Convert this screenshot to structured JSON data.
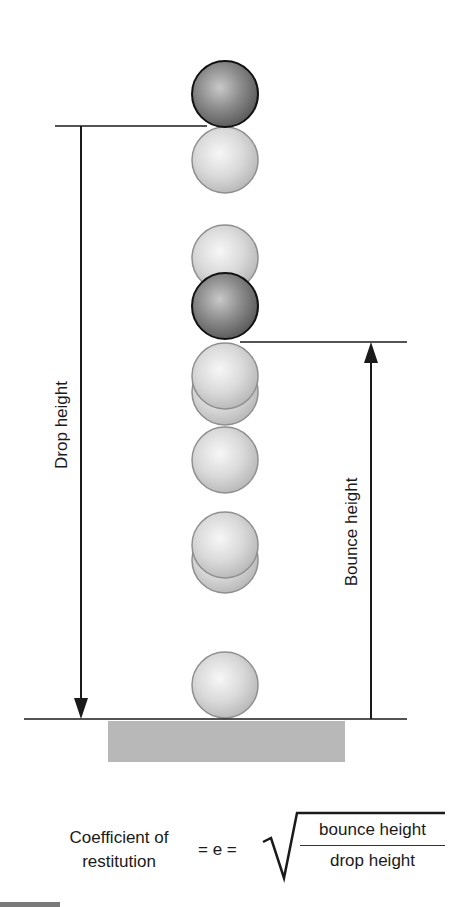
{
  "diagram": {
    "labels": {
      "drop_height": "Drop height",
      "bounce_height": "Bounce height"
    },
    "balls": [
      {
        "id": "start",
        "type": "dark",
        "cy": 94
      },
      {
        "id": "fall-1",
        "type": "light",
        "cy": 160
      },
      {
        "id": "fall-2",
        "type": "light",
        "cy": 258
      },
      {
        "id": "apex",
        "type": "dark",
        "cy": 306
      },
      {
        "id": "fall-3a",
        "type": "light",
        "cy": 392
      },
      {
        "id": "fall-3b",
        "type": "light",
        "cy": 376
      },
      {
        "id": "fall-4",
        "type": "light",
        "cy": 460
      },
      {
        "id": "fall-5a",
        "type": "light",
        "cy": 560
      },
      {
        "id": "fall-5b",
        "type": "light",
        "cy": 545
      },
      {
        "id": "ground",
        "type": "light",
        "cy": 685
      }
    ],
    "colors": {
      "line": "#1a1a1a",
      "ground_block": "#b5b5b5",
      "ball_light": "#d8d8d8",
      "ball_dark": "#7d7d7d"
    }
  },
  "formula": {
    "lhs_line1": "Coefficient of",
    "lhs_line2": "restitution",
    "equals_e": "= e =",
    "numerator": "bounce height",
    "denominator": "drop height"
  }
}
